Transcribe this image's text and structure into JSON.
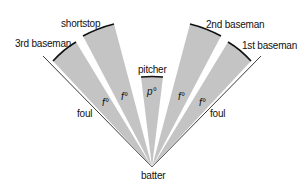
{
  "diagram": {
    "colors": {
      "wedge_fill": "#c4c4c4",
      "arc_stroke": "#111111",
      "foul_line": "#222222",
      "background": "#ffffff"
    },
    "labels": {
      "third_baseman": "3rd baseman",
      "shortstop": "shortstop",
      "pitcher": "pitcher",
      "second_baseman": "2nd baseman",
      "first_baseman": "1st baseman",
      "foul_left": "foul",
      "foul_right": "foul",
      "batter": "batter"
    },
    "angles": {
      "third_sector": "f°",
      "short_sector": "f°",
      "pitcher_sector": "p°",
      "second_sector": "f°",
      "first_sector": "f°"
    }
  }
}
